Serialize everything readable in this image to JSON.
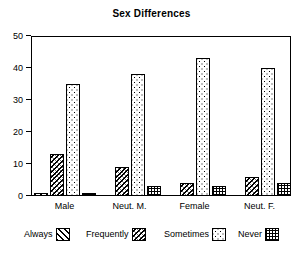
{
  "chart_data": {
    "type": "bar",
    "title": "Sex Differences",
    "xlabel": "",
    "ylabel": "",
    "categories": [
      "Male",
      "Neut. M.",
      "Female",
      "Neut. F."
    ],
    "series": [
      {
        "name": "Always",
        "values": [
          1,
          0,
          0,
          0
        ]
      },
      {
        "name": "Frequently",
        "values": [
          13,
          9,
          4,
          6
        ]
      },
      {
        "name": "Sometimes",
        "values": [
          35,
          38,
          43,
          40
        ]
      },
      {
        "name": "Never",
        "values": [
          1,
          3,
          3,
          4
        ]
      }
    ],
    "ylim": [
      0,
      50
    ],
    "yticks": [
      0,
      10,
      20,
      30,
      40,
      50
    ],
    "ytick_labels": [
      "0",
      "10",
      "20",
      "30",
      "40",
      "50"
    ],
    "grid": false,
    "legend_position": "bottom",
    "legend_entries": [
      "Always",
      "Frequently",
      "Sometimes",
      "Never"
    ],
    "patterns": [
      "diagonal-hatch",
      "dense-diagonal-hatch",
      "dots",
      "grid-crosshatch"
    ],
    "colors": {
      "axis": "#000000",
      "text": "#000000",
      "background": "#ffffff",
      "bar_outline": "#000000",
      "bar_fill": "#ffffff"
    }
  },
  "legend": {
    "items": [
      {
        "label": "Always",
        "pattern": "diagonal-hatch"
      },
      {
        "label": "Frequently",
        "pattern": "dense-diagonal-hatch"
      },
      {
        "label": "Sometimes",
        "pattern": "dots"
      },
      {
        "label": "Never",
        "pattern": "grid-crosshatch"
      }
    ]
  }
}
